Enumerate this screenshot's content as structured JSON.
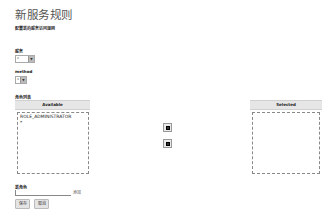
{
  "page": {
    "title": "新服务规则",
    "subtitle": "配置新的服务访问规则"
  },
  "form": {
    "service": {
      "label": "服务",
      "value": "*",
      "arrow": "▼"
    },
    "method": {
      "label": "method",
      "value": "*",
      "arrow": "▼"
    },
    "roles": {
      "label": "角色列表",
      "available_header": "Available",
      "selected_header": "Selected",
      "available_items": [
        "ROLE_ADMINISTRATOR",
        "*"
      ],
      "selected_items": [],
      "move_right_icon": "add-to-selected",
      "move_left_icon": "remove-from-selected"
    },
    "new_role": {
      "label": "新角色",
      "value": "",
      "add_link": "添加"
    }
  },
  "actions": {
    "save": "保存",
    "cancel": "取消"
  }
}
